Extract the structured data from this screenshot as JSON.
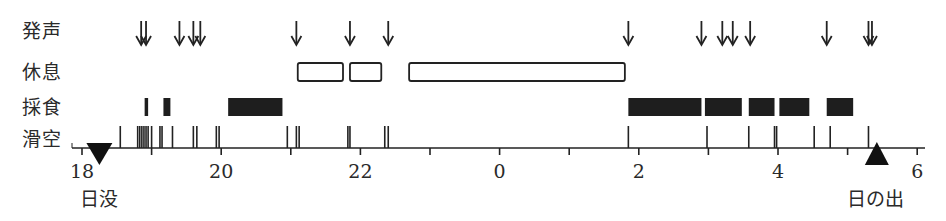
{
  "chart_data": {
    "type": "timeline",
    "title": "",
    "xlabel": "",
    "ylabel": "",
    "x_axis": {
      "unit": "hour",
      "range": [
        18,
        30
      ],
      "tick_labels": [
        "18",
        "20",
        "22",
        "0",
        "2",
        "4",
        "6"
      ],
      "tick_values": [
        18,
        20,
        22,
        24,
        26,
        28,
        30
      ],
      "minor_ticks": [
        19,
        21,
        23,
        25,
        27,
        29
      ]
    },
    "rows": [
      {
        "name": "発声",
        "kind": "arrows",
        "times": [
          18.85,
          18.92,
          19.4,
          19.6,
          19.7,
          21.08,
          21.85,
          22.4,
          25.85,
          26.9,
          27.2,
          27.35,
          27.6,
          28.7,
          29.3,
          29.35
        ]
      },
      {
        "name": "休息",
        "kind": "open_bars",
        "intervals": [
          [
            21.1,
            21.75
          ],
          [
            21.85,
            22.3
          ],
          [
            22.7,
            25.8
          ]
        ]
      },
      {
        "name": "採食",
        "kind": "filled_bars",
        "intervals": [
          [
            18.9,
            18.95
          ],
          [
            19.17,
            19.27
          ],
          [
            20.1,
            20.88
          ],
          [
            25.85,
            26.9
          ],
          [
            26.95,
            27.48
          ],
          [
            27.58,
            27.95
          ],
          [
            28.02,
            28.45
          ],
          [
            28.7,
            29.08
          ]
        ]
      },
      {
        "name": "滑空",
        "kind": "ticks",
        "times": [
          18.55,
          18.8,
          18.83,
          18.86,
          18.89,
          18.92,
          18.95,
          19.0,
          19.12,
          19.15,
          19.3,
          19.6,
          19.65,
          19.93,
          19.97,
          20.95,
          21.08,
          21.12,
          21.82,
          21.85,
          22.35,
          22.4,
          25.85,
          26.98,
          27.58,
          27.95,
          27.98,
          28.52,
          28.75,
          29.3
        ]
      }
    ],
    "markers": [
      {
        "label": "日没",
        "shape": "down-triangle",
        "time": 18.25
      },
      {
        "label": "日の出",
        "shape": "up-triangle",
        "time": 29.42
      }
    ]
  },
  "labels": {
    "row_vocal": "発声",
    "row_rest": "休息",
    "row_feed": "採食",
    "row_glide": "滑空",
    "sunset": "日没",
    "sunrise": "日の出",
    "ticks": [
      "18",
      "20",
      "22",
      "0",
      "2",
      "4",
      "6"
    ]
  }
}
